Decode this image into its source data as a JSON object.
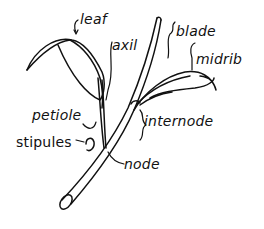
{
  "diagram": {
    "labels": {
      "leaf": "leaf",
      "axil": "axil",
      "blade": "blade",
      "midrib": "midrib",
      "petiole": "petiole",
      "internode": "internode",
      "stipules": "stipules",
      "node": "node"
    },
    "colors": {
      "ink": "#111111",
      "background": "#ffffff"
    }
  }
}
